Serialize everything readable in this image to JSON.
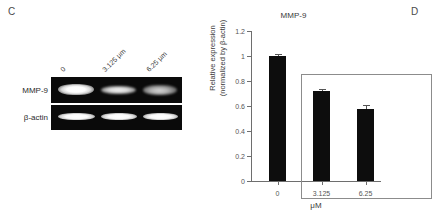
{
  "figure": {
    "panel_c_letter": "C",
    "panel_d_letter": "D"
  },
  "gel": {
    "row_labels": [
      "MMP-9",
      "β-actin"
    ],
    "lane_headers": [
      "0",
      "3.125 μm",
      "6.25 μm"
    ],
    "band_intensity": {
      "mmp9": [
        "strong",
        "medium",
        "weak"
      ],
      "bactin": [
        "strong",
        "strong",
        "strong"
      ]
    }
  },
  "chart_data": {
    "type": "bar",
    "title": "MMP-9",
    "xlabel": "μM",
    "ylabel_line1": "Relative expression",
    "ylabel_line2": "(normalized by β-actin)",
    "categories": [
      "0",
      "3.125",
      "6.25"
    ],
    "values": [
      1.0,
      0.72,
      0.58
    ],
    "errors": [
      0.02,
      0.02,
      0.025
    ],
    "ylim": [
      0,
      1.2
    ],
    "yticks": [
      "0",
      "0.2",
      "0.4",
      "0.6",
      "0.8",
      "1",
      "1.2"
    ],
    "ytick_values": [
      0,
      0.2,
      0.4,
      0.6,
      0.8,
      1.0,
      1.2
    ],
    "grid": false,
    "legend": "none",
    "bar_color": "#0d0d0d",
    "axis_color": "#6e6e6e",
    "inset_box_color": "#8c8c8c",
    "inset_box_covers": [
      "3.125",
      "6.25"
    ]
  }
}
